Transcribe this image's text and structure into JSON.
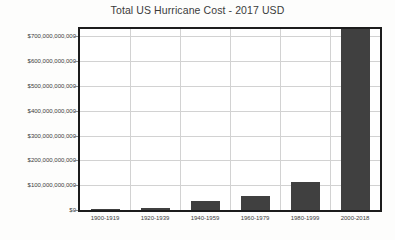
{
  "chart_data": {
    "type": "bar",
    "title": "Total US Hurricane Cost - 2017 USD",
    "xlabel": "",
    "ylabel": "",
    "categories": [
      "1900-1919",
      "1920-1939",
      "1940-1959",
      "1960-1979",
      "1980-1999",
      "2000-2018"
    ],
    "values": [
      5000000000,
      8000000000,
      36000000000,
      56000000000,
      112000000000,
      730000000000
    ],
    "ylim": [
      0,
      730000000000
    ],
    "yticks": [
      0,
      100000000000,
      200000000000,
      300000000000,
      400000000000,
      500000000000,
      600000000000,
      700000000000
    ],
    "ytick_labels": [
      "$0",
      "$100,000,000,000",
      "$200,000,000,000",
      "$300,000,000,000",
      "$400,000,000,000",
      "$500,000,000,000",
      "$600,000,000,000",
      "$700,000,000,000"
    ],
    "grid": true,
    "legend": false,
    "bar_color": "#404040",
    "grid_color": "#d2d2d2",
    "axis_color": "#1c1c1c",
    "text_color": "#3b3b3b"
  }
}
